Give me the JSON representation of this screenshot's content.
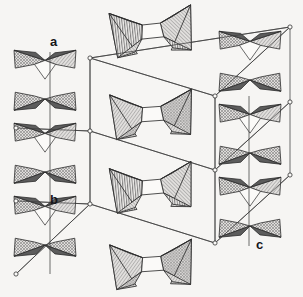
{
  "figure": {
    "background_color": "#f6f5f3",
    "line_color": "#3a3a3a",
    "width": 303,
    "height": 297
  },
  "axes": {
    "items": [
      {
        "label": "a",
        "x": 50,
        "y": 46,
        "direction": "vertical-down",
        "name": "a-axis"
      },
      {
        "label": "b",
        "x": 50,
        "y": 204,
        "direction": "oblique-right",
        "name": "b-axis"
      },
      {
        "label": "c",
        "x": 256,
        "y": 249,
        "direction": "vertical-up",
        "name": "c-axis"
      }
    ]
  },
  "unit_cell": {
    "stroke": "#4a4a4a",
    "stroke_width": 0.8,
    "vertex_marker": "open-circle",
    "vertex_radius": 2.1,
    "vertices": [
      {
        "id": "v1",
        "x": 90,
        "y": 58
      },
      {
        "id": "v2",
        "x": 215,
        "y": 96
      },
      {
        "id": "v3",
        "x": 290,
        "y": 27
      },
      {
        "id": "v4",
        "x": 90,
        "y": 131
      },
      {
        "id": "v5",
        "x": 16,
        "y": 128
      },
      {
        "id": "v6",
        "x": 215,
        "y": 170
      },
      {
        "id": "v7",
        "x": 290,
        "y": 102
      },
      {
        "id": "v8",
        "x": 90,
        "y": 204
      },
      {
        "id": "v9",
        "x": 16,
        "y": 201
      },
      {
        "id": "v10",
        "x": 215,
        "y": 243
      },
      {
        "id": "v11",
        "x": 290,
        "y": 175
      },
      {
        "id": "v12",
        "x": 16,
        "y": 274
      }
    ],
    "edges": [
      [
        "v1",
        "v2"
      ],
      [
        "v1",
        "v3"
      ],
      [
        "v2",
        "v3"
      ],
      [
        "v4",
        "v5"
      ],
      [
        "v4",
        "v6"
      ],
      [
        "v6",
        "v7"
      ],
      [
        "v8",
        "v9"
      ],
      [
        "v8",
        "v10"
      ],
      [
        "v10",
        "v11"
      ],
      [
        "v1",
        "v4"
      ],
      [
        "v4",
        "v8"
      ],
      [
        "v8",
        "v12"
      ],
      [
        "v2",
        "v6"
      ],
      [
        "v6",
        "v10"
      ],
      [
        "v3",
        "v7"
      ],
      [
        "v7",
        "v11"
      ]
    ]
  },
  "patterns": {
    "cross_hatch": {
      "name": "cross-hatch",
      "fill": "#d9d8d6",
      "ink": "#6c6c6c"
    },
    "diag_hatch": {
      "name": "diagonal-hatch",
      "fill": "#dedcda",
      "ink": "#6f6f6f"
    },
    "vert_hatch": {
      "name": "vertical-line-hatch",
      "fill": "#eceae8",
      "ink": "#5f5f5f"
    },
    "horiz_hatch": {
      "name": "horizontal-line-hatch",
      "fill": "#e2e0de",
      "ink": "#666666"
    },
    "solid_dark": {
      "name": "solid-dark-gray",
      "fill": "#5d5d5d",
      "ink": "#5d5d5d"
    },
    "solid_light": {
      "name": "solid-white-face",
      "fill": "#fbfaf8",
      "ink": "#fbfaf8"
    }
  },
  "clusters": {
    "columns": [
      {
        "name": "left-chain",
        "x": 45,
        "nodes": [
          {
            "id": "L1",
            "cx": 45,
            "cy": 63,
            "style": "wide",
            "scale": 1.0
          },
          {
            "id": "L2",
            "cx": 45,
            "cy": 97,
            "style": "wide",
            "scale": 1.0
          },
          {
            "id": "L3",
            "cx": 45,
            "cy": 136,
            "style": "wide",
            "scale": 1.0
          },
          {
            "id": "L4",
            "cx": 45,
            "cy": 170,
            "style": "wide",
            "scale": 1.0
          },
          {
            "id": "L5",
            "cx": 45,
            "cy": 209,
            "style": "wide",
            "scale": 1.0
          },
          {
            "id": "L6",
            "cx": 45,
            "cy": 243,
            "style": "wide",
            "scale": 1.0
          }
        ]
      },
      {
        "name": "middle-bowties",
        "x": 150,
        "nodes": [
          {
            "id": "M1",
            "cx": 152,
            "cy": 30,
            "style": "bowtie-vert",
            "rot": -6
          },
          {
            "id": "M2",
            "cx": 152,
            "cy": 113,
            "style": "bowtie-diag",
            "rot": -4
          },
          {
            "id": "M3",
            "cx": 152,
            "cy": 186,
            "style": "bowtie-vert",
            "rot": -5
          },
          {
            "id": "M4",
            "cx": 152,
            "cy": 263,
            "style": "bowtie-diag",
            "rot": -4
          }
        ]
      },
      {
        "name": "right-chain",
        "x": 250,
        "nodes": [
          {
            "id": "R1",
            "cx": 250,
            "cy": 44,
            "style": "wide",
            "scale": 1.0
          },
          {
            "id": "R2",
            "cx": 250,
            "cy": 78,
            "style": "wide",
            "scale": 1.0
          },
          {
            "id": "R3",
            "cx": 250,
            "cy": 117,
            "style": "wide",
            "scale": 1.0
          },
          {
            "id": "R4",
            "cx": 250,
            "cy": 151,
            "style": "wide",
            "scale": 1.0
          },
          {
            "id": "R5",
            "cx": 250,
            "cy": 190,
            "style": "wide",
            "scale": 1.0
          },
          {
            "id": "R6",
            "cx": 250,
            "cy": 224,
            "style": "wide",
            "scale": 1.0
          }
        ]
      }
    ]
  }
}
